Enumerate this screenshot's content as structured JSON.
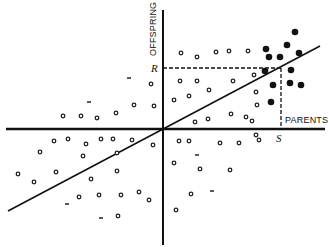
{
  "diagram": {
    "type": "scatter-regression",
    "labels": {
      "y_axis": "OFFSPRING",
      "x_axis": "PARENTS",
      "r_mark": "R",
      "s_mark": "S"
    },
    "colors": {
      "ink": "#111111",
      "background": "#ffffff"
    },
    "axes": {
      "origin": [
        163,
        129
      ],
      "x_range": [
        6,
        325
      ],
      "y_range": [
        10,
        245
      ]
    },
    "regression_line": {
      "from": [
        8,
        211
      ],
      "to": [
        320,
        46
      ]
    },
    "guides": {
      "point": [
        281,
        68
      ]
    },
    "hollow_points": [
      [
        63,
        116
      ],
      [
        81,
        116
      ],
      [
        97,
        118
      ],
      [
        116,
        113
      ],
      [
        134,
        105
      ],
      [
        154,
        106
      ],
      [
        151,
        84
      ],
      [
        181,
        53
      ],
      [
        197,
        57
      ],
      [
        216,
        52
      ],
      [
        229,
        51
      ],
      [
        248,
        51
      ],
      [
        180,
        81
      ],
      [
        197,
        81
      ],
      [
        233,
        81
      ],
      [
        174,
        100
      ],
      [
        189,
        96
      ],
      [
        209,
        90
      ],
      [
        256,
        92
      ],
      [
        254,
        75
      ],
      [
        257,
        105
      ],
      [
        195,
        122
      ],
      [
        208,
        119
      ],
      [
        231,
        114
      ],
      [
        246,
        117
      ],
      [
        252,
        121
      ],
      [
        54,
        141
      ],
      [
        68,
        139
      ],
      [
        86,
        144
      ],
      [
        101,
        139
      ],
      [
        113,
        139
      ],
      [
        132,
        140
      ],
      [
        153,
        145
      ],
      [
        40,
        152
      ],
      [
        83,
        156
      ],
      [
        18,
        174
      ],
      [
        34,
        182
      ],
      [
        56,
        172
      ],
      [
        117,
        153
      ],
      [
        91,
        179
      ],
      [
        117,
        171
      ],
      [
        79,
        197
      ],
      [
        99,
        195
      ],
      [
        121,
        195
      ],
      [
        139,
        192
      ],
      [
        149,
        200
      ],
      [
        118,
        216
      ],
      [
        179,
        141
      ],
      [
        189,
        141
      ],
      [
        220,
        143
      ],
      [
        239,
        143
      ],
      [
        256,
        135
      ],
      [
        259,
        140
      ],
      [
        174,
        163
      ],
      [
        200,
        169
      ],
      [
        230,
        170
      ],
      [
        191,
        194
      ],
      [
        176,
        210
      ]
    ],
    "dash_points": [
      [
        89,
        102
      ],
      [
        129,
        78
      ],
      [
        67,
        204
      ],
      [
        101,
        218
      ],
      [
        197,
        155
      ],
      [
        212,
        191
      ]
    ],
    "filled_points": [
      [
        295,
        32
      ],
      [
        266,
        49
      ],
      [
        287,
        45
      ],
      [
        299,
        53
      ],
      [
        269,
        57
      ],
      [
        280,
        57
      ],
      [
        265,
        71
      ],
      [
        291,
        70
      ],
      [
        273,
        85
      ],
      [
        290,
        83
      ],
      [
        301,
        85
      ],
      [
        271,
        102
      ]
    ]
  }
}
